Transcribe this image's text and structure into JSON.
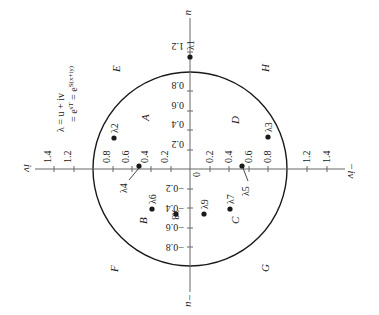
{
  "figure": {
    "orientation": "rotated 90 degrees counter-clockwise",
    "formula": {
      "line1": "λ = u + iv",
      "line2": "= e^{sT} = e^{S(x+iy)}"
    },
    "axes": {
      "positive_u": "u",
      "negative_u": "−u",
      "positive_iv": "iv",
      "negative_iv": "−iv",
      "origin": "0"
    },
    "u_ticks_positive": [
      "0.2",
      "0.4",
      "0.6",
      "0.8",
      "1.2"
    ],
    "u_ticks_negative": [
      "0.2",
      "0.4",
      "0.6",
      "0.8"
    ],
    "v_ticks_left": [
      "0.2",
      "0.4",
      "0.6",
      "0.8",
      "1.2",
      "1.4"
    ],
    "v_ticks_right": [
      "0.2",
      "0.4",
      "0.6",
      "0.8",
      "1.2",
      "1.4"
    ],
    "unit_circle_radius": 1.0,
    "regions": {
      "A": "A",
      "B": "B",
      "C": "C",
      "D": "D",
      "E": "E",
      "F": "F",
      "G": "G",
      "H": "H"
    },
    "points": [
      {
        "label": "λ1",
        "name": "lambda-1"
      },
      {
        "label": "λ2",
        "name": "lambda-2"
      },
      {
        "label": "λ3",
        "name": "lambda-3"
      },
      {
        "label": "λ4",
        "name": "lambda-4"
      },
      {
        "label": "λ5",
        "name": "lambda-5"
      },
      {
        "label": "λ6",
        "name": "lambda-6"
      },
      {
        "label": "λ7",
        "name": "lambda-7"
      },
      {
        "label": "λ8",
        "name": "lambda-8"
      },
      {
        "label": "λ9",
        "name": "lambda-9"
      }
    ],
    "colors": {
      "ink": "#1a1a1a",
      "axis": "#666666",
      "background": "#ffffff"
    }
  }
}
